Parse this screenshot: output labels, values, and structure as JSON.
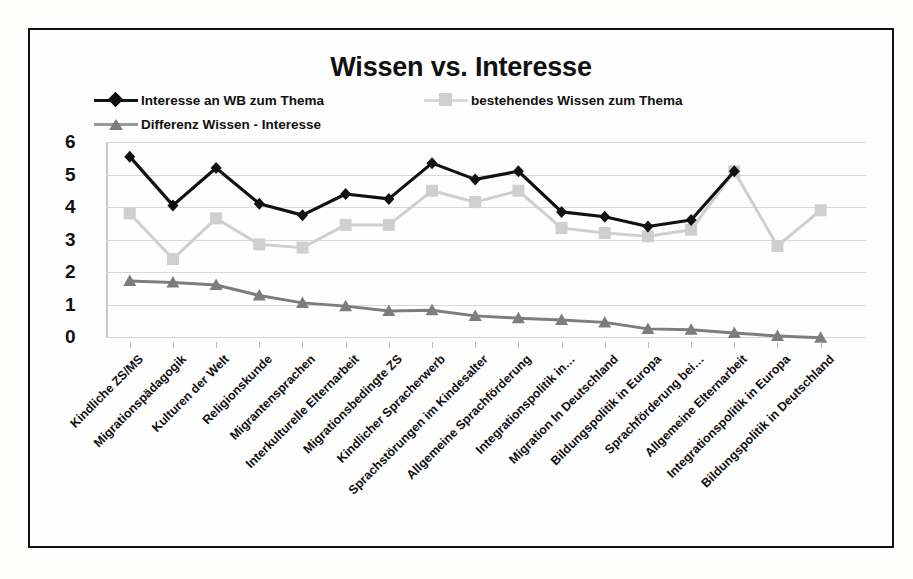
{
  "chart_data": {
    "type": "line",
    "title": "Wissen vs. Interesse",
    "xlabel": "",
    "ylabel": "",
    "ylim": [
      0,
      6
    ],
    "yticks": [
      0,
      1,
      2,
      3,
      4,
      5,
      6
    ],
    "grid": true,
    "legend_position": "top",
    "categories": [
      "Kindliche ZS/MS",
      "Migrationspädagogik",
      "Kulturen der Welt",
      "Religionskunde",
      "Migrantensprachen",
      "Interkulturelle Elternarbeit",
      "Migrationsbedingte ZS",
      "Kindlicher Spracherwerb",
      "Sprachstörungen im Kindesalter",
      "Allgemeine Sprachförderung",
      "Integrationspolitik in…",
      "Migration In Deutschland",
      "Bildungspolitik in Europa",
      "Sprachförderung bei…",
      "Allgemeine Elternarbeit",
      "Integrationspolitik in Europa",
      "Bildungspolitik in Deutschland"
    ],
    "series": [
      {
        "name": "Interesse an WB zum Thema",
        "color": "#111111",
        "marker": "diamond",
        "values": [
          5.55,
          4.05,
          5.2,
          4.1,
          3.75,
          4.4,
          4.25,
          5.35,
          4.85,
          5.1,
          3.85,
          3.7,
          3.4,
          3.6,
          5.1,
          null,
          null
        ]
      },
      {
        "name": "bestehendes Wissen zum Thema",
        "color": "#cfcfcf",
        "marker": "square",
        "values": [
          3.8,
          2.4,
          3.65,
          2.85,
          2.75,
          3.45,
          3.45,
          4.5,
          4.15,
          4.5,
          3.35,
          3.2,
          3.1,
          3.3,
          5.1,
          2.8,
          3.9
        ]
      },
      {
        "name": "Differenz Wissen - Interesse",
        "color": "#7d7d7d",
        "marker": "triangle",
        "values": [
          1.72,
          1.68,
          1.6,
          1.28,
          1.05,
          0.95,
          0.8,
          0.82,
          0.65,
          0.58,
          0.52,
          0.45,
          0.25,
          0.22,
          0.12,
          0.03,
          -0.02
        ]
      }
    ]
  },
  "legend": {
    "items": [
      {
        "label": "Interesse an WB zum Thema",
        "marker": "diamond-marker-icon"
      },
      {
        "label": "bestehendes Wissen zum Thema",
        "marker": "square-marker-icon"
      },
      {
        "label": "Differenz Wissen - Interesse",
        "marker": "triangle-marker-icon"
      }
    ]
  }
}
